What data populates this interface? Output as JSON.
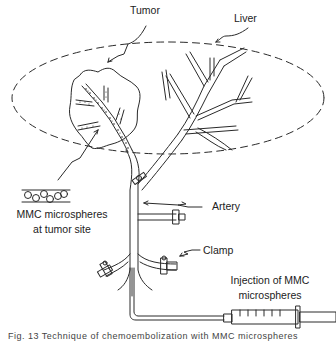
{
  "labels": {
    "tumor": "Tumor",
    "liver": "Liver",
    "microspheres_line1": "MMC microspheres",
    "microspheres_line2": "at tumor site",
    "artery": "Artery",
    "clamp": "Clamp",
    "injection_line1": "Injection of MMC",
    "injection_line2": "microspheres"
  },
  "caption": "Fig. 13  Technique of chemoembolization with MMC microspheres",
  "colors": {
    "line": "#2a2a2a",
    "background": "#ffffff",
    "text": "#222222"
  }
}
